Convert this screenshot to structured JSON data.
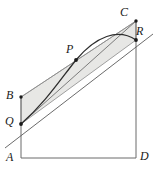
{
  "figure": {
    "colors": {
      "stroke": "#4d4d4d",
      "curve": "#3a3a3a",
      "shade_fill": "#e7e7e5",
      "shade_stroke": "#8a8a8a",
      "label": "#1a1a1a",
      "point": "#1a1a1a",
      "background": "#ffffff"
    },
    "labels": [
      {
        "id": "A",
        "text": "A",
        "x": 6,
        "y": 151
      },
      {
        "id": "B",
        "text": "B",
        "x": 6,
        "y": 89
      },
      {
        "id": "C",
        "text": "C",
        "x": 120,
        "y": 6
      },
      {
        "id": "D",
        "text": "D",
        "x": 140,
        "y": 150
      },
      {
        "id": "P",
        "text": "P",
        "x": 66,
        "y": 43
      },
      {
        "id": "Q",
        "text": "Q",
        "x": 5,
        "y": 115
      },
      {
        "id": "R",
        "text": "R",
        "x": 136,
        "y": 25
      }
    ],
    "points": [
      {
        "id": "A",
        "x": 21,
        "y": 158
      },
      {
        "id": "B",
        "x": 21,
        "y": 97
      },
      {
        "id": "C",
        "x": 136,
        "y": 21
      },
      {
        "id": "D",
        "x": 136,
        "y": 158
      },
      {
        "id": "P",
        "x": 76,
        "y": 60
      },
      {
        "id": "Q",
        "x": 21,
        "y": 124
      },
      {
        "id": "R",
        "x": 136,
        "y": 40
      }
    ],
    "marked_points": [
      "B",
      "C",
      "P",
      "Q",
      "R"
    ],
    "geometry": {
      "outline_path": "M 21 158 L 21 97 L 136 21 L 136 158 Z",
      "left_side_path": "M 21 97 L 21 158",
      "right_side_path": "M 136 21 L 136 158",
      "base_path": "M 21 158 L 136 158",
      "slant_path": "M 21 97 L 136 21",
      "shaded_region_path": "M 21 97 L 136 21 L 136 40 L 21 124 Z",
      "chord_QC_path": "M 21 124 L 136 21",
      "curve_path": "M 21 124 C 45 103 60 80 76 60 C 96 36 118 28 136 40",
      "tangent_line_path": "M 5 148 L 153 34"
    }
  }
}
